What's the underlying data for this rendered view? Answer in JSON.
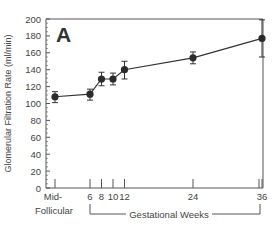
{
  "chart_data": {
    "type": "line",
    "panel_label": "A",
    "title": "",
    "xlabel": "Gestational Weeks",
    "ylabel": "Glomerular Filtration Rate (ml/min)",
    "ylim": [
      0,
      200
    ],
    "yticks": [
      0,
      20,
      40,
      60,
      80,
      100,
      120,
      140,
      160,
      180,
      200
    ],
    "categories": [
      "Mid-Follicular",
      "6",
      "8",
      "10",
      "12",
      "24",
      "36"
    ],
    "category_lines": [
      [
        "Mid-",
        "Follicular"
      ],
      [
        "6"
      ],
      [
        "8"
      ],
      [
        "10"
      ],
      [
        "12"
      ],
      [
        "24"
      ],
      [
        "36"
      ]
    ],
    "grid": false,
    "legend": null,
    "series": [
      {
        "name": "GFR",
        "values": [
          108,
          111,
          129,
          129,
          140,
          154,
          177
        ],
        "error_low": [
          101,
          104,
          121,
          122,
          129,
          147,
          155
        ],
        "error_high": [
          114,
          117,
          137,
          136,
          150,
          161,
          199
        ]
      }
    ]
  },
  "colors": {
    "line": "#333333",
    "marker": "#2b2b2b",
    "axis": "#555555",
    "text": "#444444"
  }
}
